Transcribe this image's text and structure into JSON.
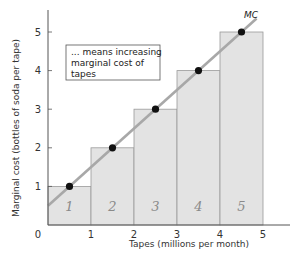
{
  "chart_data": {
    "type": "bar",
    "title": "",
    "xlabel": "Tapes (millions per month)",
    "ylabel": "Marginal cost (bottles of soda per tape)",
    "x_ticks": [
      "0",
      "1",
      "2",
      "3",
      "4",
      "5"
    ],
    "y_ticks": [
      "1",
      "2",
      "3",
      "4",
      "5"
    ],
    "xlim": [
      0,
      5.7
    ],
    "ylim": [
      0,
      5.5
    ],
    "grid": false,
    "categories": [
      "1",
      "2",
      "3",
      "4",
      "5"
    ],
    "bars": [
      {
        "x_start": 0,
        "x_end": 1,
        "height": 1,
        "handwritten_label": "1"
      },
      {
        "x_start": 1,
        "x_end": 2,
        "height": 2,
        "handwritten_label": "2"
      },
      {
        "x_start": 2,
        "x_end": 3,
        "height": 3,
        "handwritten_label": "3"
      },
      {
        "x_start": 3,
        "x_end": 4,
        "height": 4,
        "handwritten_label": "4"
      },
      {
        "x_start": 4,
        "x_end": 5,
        "height": 5,
        "handwritten_label": "5"
      }
    ],
    "series": [
      {
        "name": "MC",
        "type": "line",
        "points": [
          {
            "x": 0.5,
            "y": 1
          },
          {
            "x": 1.5,
            "y": 2
          },
          {
            "x": 2.5,
            "y": 3
          },
          {
            "x": 3.5,
            "y": 4
          },
          {
            "x": 4.5,
            "y": 5
          }
        ],
        "line_extent": [
          {
            "x": 0,
            "y": 0.5
          },
          {
            "x": 4.85,
            "y": 5.35
          }
        ]
      }
    ],
    "annotations": [
      {
        "text": "... means increasing marginal cost of tapes",
        "boxed": true
      },
      {
        "text": "MC",
        "attached_to": "MC line end"
      }
    ],
    "colors": {
      "bar_fill": "#e3e3e3",
      "bar_stroke": "#9a9a9a",
      "line": "#a8a8a8",
      "point": "#111111",
      "axis": "#555555"
    }
  },
  "labels": {
    "mc": "MC",
    "origin": "0",
    "ann_line1": "... means increasing",
    "ann_line2": "marginal cost of",
    "ann_line3": "tapes"
  }
}
